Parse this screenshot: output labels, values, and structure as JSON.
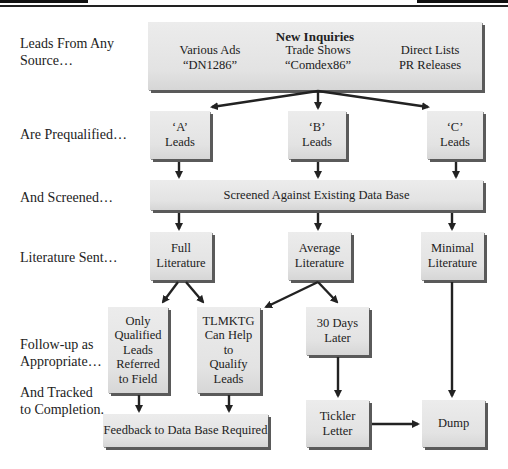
{
  "header_rules": {
    "left_bar": "thick rule",
    "right_bar": "thick rule"
  },
  "stage_labels": [
    {
      "line1": "Leads From Any",
      "line2": "Source…"
    },
    {
      "line1": "Are Prequalified…",
      "line2": ""
    },
    {
      "line1": "And Screened…",
      "line2": ""
    },
    {
      "line1": "Literature Sent…",
      "line2": ""
    },
    {
      "line1": "Follow-up as",
      "line2": "Appropriate…"
    },
    {
      "line1": "And Tracked",
      "line2": "to Completion."
    }
  ],
  "inquiries": {
    "title": "New Inquiries",
    "sources": [
      {
        "line1": "Various Ads",
        "line2": "“DN1286”"
      },
      {
        "line1": "Trade Shows",
        "line2": "“Comdex86”"
      },
      {
        "line1": "Direct Lists",
        "line2": "PR Releases"
      }
    ]
  },
  "lead_grades": [
    {
      "line1": "‘A’",
      "line2": "Leads"
    },
    {
      "line1": "‘B’",
      "line2": "Leads"
    },
    {
      "line1": "‘C’",
      "line2": "Leads"
    }
  ],
  "screen": {
    "label": "Screened Against Existing Data Base"
  },
  "literature": [
    {
      "line1": "Full",
      "line2": "Literature"
    },
    {
      "line1": "Average",
      "line2": "Literature"
    },
    {
      "line1": "Minimal",
      "line2": "Literature"
    }
  ],
  "followup": {
    "qualified": [
      "Only",
      "Qualified",
      "Leads",
      "Referred",
      "to Field"
    ],
    "tlmktg": [
      "TLMKTG",
      "Can Help",
      "to",
      "Qualify",
      "Leads"
    ],
    "thirty_days": {
      "line1": "30 Days",
      "line2": "Later"
    },
    "tickler": {
      "line1": "Tickler",
      "line2": "Letter"
    },
    "dump": {
      "label": "Dump"
    },
    "feedback": {
      "label": "Feedback to Data Base Required"
    }
  },
  "colors": {
    "box_fill": "#e6e6e6",
    "box_shadow": "#5a5a5a",
    "arrow": "#222222",
    "text": "#222222"
  }
}
